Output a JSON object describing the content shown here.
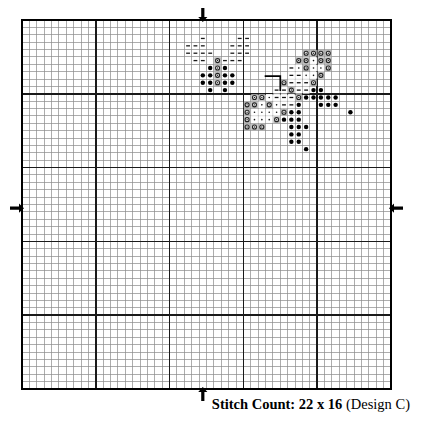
{
  "document": {
    "type": "cross-stitch-pattern-chart",
    "caption_bold": "Stitch Count: 22 x 16",
    "caption_regular": "(Design C)",
    "caption_full": "Stitch Count: 22 x 16 (Design C)"
  },
  "grid": {
    "cols": 50,
    "rows": 50,
    "cell_size": 7.38,
    "origin_x": 22,
    "origin_y": 20,
    "minor_line_color": "#8a8a8a",
    "minor_line_width": 0.7,
    "major_line_color": "#1a1a1a",
    "major_line_width": 1.5,
    "major_every": 10,
    "border_color": "#000000",
    "border_width": 2
  },
  "center_markers": [
    {
      "name": "top-center-arrow",
      "direction": "down",
      "col": 24,
      "side": "top"
    },
    {
      "name": "bottom-center-arrow",
      "direction": "up",
      "col": 24,
      "side": "bottom"
    },
    {
      "name": "left-center-arrow",
      "direction": "right",
      "row": 25,
      "side": "left"
    },
    {
      "name": "right-center-arrow",
      "direction": "left",
      "row": 25,
      "side": "right"
    }
  ],
  "symbols": {
    "legend": [
      {
        "key": "dash",
        "glyph": "–",
        "description": "dash-stitch",
        "fill": "#ffffff",
        "ink": "#1a1a1a"
      },
      {
        "key": "filled-dot",
        "glyph": "●",
        "description": "filled-dot-stitch",
        "fill": "#ffffff",
        "ink": "#000000"
      },
      {
        "key": "open-circle",
        "glyph": "◎",
        "description": "open-circle-stitch",
        "fill": "#b8b8b8",
        "ink": "#222222"
      },
      {
        "key": "small-dot",
        "glyph": "·",
        "description": "small-dot-stitch",
        "fill": "#d8d8d8",
        "ink": "#111111"
      },
      {
        "key": "dash-shaded",
        "glyph": "–",
        "description": "dash-on-shade",
        "fill": "#d8d8d8",
        "ink": "#111111"
      }
    ]
  },
  "chart_data": {
    "type": "heatmap",
    "title": "Stitch Count: 22 x 16 (Design C)",
    "xlabel": "",
    "ylabel": "",
    "grid_cols": 50,
    "grid_rows": 50,
    "cells": [
      {
        "c": 24,
        "r": 2,
        "s": "dash"
      },
      {
        "c": 29,
        "r": 2,
        "s": "dash"
      },
      {
        "c": 30,
        "r": 2,
        "s": "dash"
      },
      {
        "c": 22,
        "r": 3,
        "s": "dash"
      },
      {
        "c": 23,
        "r": 3,
        "s": "dash"
      },
      {
        "c": 24,
        "r": 3,
        "s": "dash"
      },
      {
        "c": 28,
        "r": 3,
        "s": "dash"
      },
      {
        "c": 29,
        "r": 3,
        "s": "dash"
      },
      {
        "c": 30,
        "r": 3,
        "s": "dash"
      },
      {
        "c": 22,
        "r": 4,
        "s": "dash"
      },
      {
        "c": 23,
        "r": 4,
        "s": "dash"
      },
      {
        "c": 24,
        "r": 4,
        "s": "dash"
      },
      {
        "c": 25,
        "r": 4,
        "s": "dash"
      },
      {
        "c": 28,
        "r": 4,
        "s": "dash"
      },
      {
        "c": 29,
        "r": 4,
        "s": "dash"
      },
      {
        "c": 30,
        "r": 4,
        "s": "dash"
      },
      {
        "c": 23,
        "r": 5,
        "s": "dash"
      },
      {
        "c": 24,
        "r": 5,
        "s": "dash"
      },
      {
        "c": 26,
        "r": 5,
        "s": "open-circle"
      },
      {
        "c": 27,
        "r": 5,
        "s": "dash"
      },
      {
        "c": 28,
        "r": 5,
        "s": "dash"
      },
      {
        "c": 29,
        "r": 5,
        "s": "dash"
      },
      {
        "c": 25,
        "r": 6,
        "s": "filled-dot"
      },
      {
        "c": 26,
        "r": 6,
        "s": "open-circle"
      },
      {
        "c": 27,
        "r": 6,
        "s": "filled-dot"
      },
      {
        "c": 24,
        "r": 7,
        "s": "filled-dot"
      },
      {
        "c": 25,
        "r": 7,
        "s": "filled-dot"
      },
      {
        "c": 26,
        "r": 7,
        "s": "open-circle"
      },
      {
        "c": 27,
        "r": 7,
        "s": "filled-dot"
      },
      {
        "c": 28,
        "r": 7,
        "s": "filled-dot"
      },
      {
        "c": 24,
        "r": 8,
        "s": "filled-dot"
      },
      {
        "c": 25,
        "r": 8,
        "s": "filled-dot"
      },
      {
        "c": 26,
        "r": 8,
        "s": "open-circle"
      },
      {
        "c": 27,
        "r": 8,
        "s": "filled-dot"
      },
      {
        "c": 28,
        "r": 8,
        "s": "filled-dot"
      },
      {
        "c": 25,
        "r": 9,
        "s": "filled-dot"
      },
      {
        "c": 27,
        "r": 9,
        "s": "filled-dot"
      },
      {
        "c": 38,
        "r": 4,
        "s": "open-circle"
      },
      {
        "c": 39,
        "r": 4,
        "s": "open-circle"
      },
      {
        "c": 40,
        "r": 4,
        "s": "open-circle"
      },
      {
        "c": 41,
        "r": 4,
        "s": "open-circle"
      },
      {
        "c": 37,
        "r": 5,
        "s": "open-circle"
      },
      {
        "c": 38,
        "r": 5,
        "s": "open-circle"
      },
      {
        "c": 39,
        "r": 5,
        "s": "small-dot"
      },
      {
        "c": 40,
        "r": 5,
        "s": "open-circle"
      },
      {
        "c": 41,
        "r": 5,
        "s": "open-circle"
      },
      {
        "c": 36,
        "r": 6,
        "s": "dash-shaded"
      },
      {
        "c": 37,
        "r": 6,
        "s": "small-dot"
      },
      {
        "c": 38,
        "r": 6,
        "s": "open-circle"
      },
      {
        "c": 39,
        "r": 6,
        "s": "small-dot"
      },
      {
        "c": 40,
        "r": 6,
        "s": "small-dot"
      },
      {
        "c": 41,
        "r": 6,
        "s": "open-circle"
      },
      {
        "c": 36,
        "r": 7,
        "s": "dash-shaded"
      },
      {
        "c": 37,
        "r": 7,
        "s": "dash-shaded"
      },
      {
        "c": 38,
        "r": 7,
        "s": "small-dot"
      },
      {
        "c": 39,
        "r": 7,
        "s": "small-dot"
      },
      {
        "c": 40,
        "r": 7,
        "s": "open-circle"
      },
      {
        "c": 35,
        "r": 8,
        "s": "open-circle"
      },
      {
        "c": 36,
        "r": 8,
        "s": "dash-shaded"
      },
      {
        "c": 37,
        "r": 8,
        "s": "dash-shaded"
      },
      {
        "c": 38,
        "r": 8,
        "s": "dash-shaded"
      },
      {
        "c": 39,
        "r": 8,
        "s": "open-circle"
      },
      {
        "c": 34,
        "r": 9,
        "s": "dash-shaded"
      },
      {
        "c": 35,
        "r": 9,
        "s": "dash-shaded"
      },
      {
        "c": 36,
        "r": 9,
        "s": "open-circle"
      },
      {
        "c": 37,
        "r": 9,
        "s": "dash-shaded"
      },
      {
        "c": 38,
        "r": 9,
        "s": "dash-shaded"
      },
      {
        "c": 39,
        "r": 9,
        "s": "filled-dot"
      },
      {
        "c": 40,
        "r": 9,
        "s": "filled-dot"
      },
      {
        "c": 31,
        "r": 10,
        "s": "open-circle"
      },
      {
        "c": 32,
        "r": 10,
        "s": "open-circle"
      },
      {
        "c": 33,
        "r": 10,
        "s": "small-dot"
      },
      {
        "c": 34,
        "r": 10,
        "s": "dash-shaded"
      },
      {
        "c": 35,
        "r": 10,
        "s": "dash-shaded"
      },
      {
        "c": 36,
        "r": 10,
        "s": "dash-shaded"
      },
      {
        "c": 37,
        "r": 10,
        "s": "open-circle"
      },
      {
        "c": 38,
        "r": 10,
        "s": "filled-dot"
      },
      {
        "c": 39,
        "r": 10,
        "s": "filled-dot"
      },
      {
        "c": 40,
        "r": 10,
        "s": "filled-dot"
      },
      {
        "c": 41,
        "r": 10,
        "s": "filled-dot"
      },
      {
        "c": 42,
        "r": 10,
        "s": "filled-dot"
      },
      {
        "c": 30,
        "r": 11,
        "s": "open-circle"
      },
      {
        "c": 31,
        "r": 11,
        "s": "open-circle"
      },
      {
        "c": 32,
        "r": 11,
        "s": "small-dot"
      },
      {
        "c": 33,
        "r": 11,
        "s": "open-circle"
      },
      {
        "c": 34,
        "r": 11,
        "s": "small-dot"
      },
      {
        "c": 35,
        "r": 11,
        "s": "dash-shaded"
      },
      {
        "c": 36,
        "r": 11,
        "s": "dash-shaded"
      },
      {
        "c": 37,
        "r": 11,
        "s": "filled-dot"
      },
      {
        "c": 40,
        "r": 11,
        "s": "filled-dot"
      },
      {
        "c": 41,
        "r": 11,
        "s": "filled-dot"
      },
      {
        "c": 42,
        "r": 11,
        "s": "filled-dot"
      },
      {
        "c": 30,
        "r": 12,
        "s": "open-circle"
      },
      {
        "c": 31,
        "r": 12,
        "s": "small-dot"
      },
      {
        "c": 32,
        "r": 12,
        "s": "small-dot"
      },
      {
        "c": 33,
        "r": 12,
        "s": "small-dot"
      },
      {
        "c": 34,
        "r": 12,
        "s": "small-dot"
      },
      {
        "c": 35,
        "r": 12,
        "s": "open-circle"
      },
      {
        "c": 36,
        "r": 12,
        "s": "filled-dot"
      },
      {
        "c": 37,
        "r": 12,
        "s": "filled-dot"
      },
      {
        "c": 44,
        "r": 12,
        "s": "filled-dot"
      },
      {
        "c": 30,
        "r": 13,
        "s": "open-circle"
      },
      {
        "c": 31,
        "r": 13,
        "s": "small-dot"
      },
      {
        "c": 32,
        "r": 13,
        "s": "small-dot"
      },
      {
        "c": 33,
        "r": 13,
        "s": "small-dot"
      },
      {
        "c": 34,
        "r": 13,
        "s": "open-circle"
      },
      {
        "c": 35,
        "r": 13,
        "s": "filled-dot"
      },
      {
        "c": 36,
        "r": 13,
        "s": "filled-dot"
      },
      {
        "c": 37,
        "r": 13,
        "s": "filled-dot"
      },
      {
        "c": 30,
        "r": 14,
        "s": "open-circle"
      },
      {
        "c": 31,
        "r": 14,
        "s": "open-circle"
      },
      {
        "c": 32,
        "r": 14,
        "s": "open-circle"
      },
      {
        "c": 36,
        "r": 14,
        "s": "filled-dot"
      },
      {
        "c": 37,
        "r": 14,
        "s": "filled-dot"
      },
      {
        "c": 38,
        "r": 14,
        "s": "filled-dot"
      },
      {
        "c": 36,
        "r": 15,
        "s": "filled-dot"
      },
      {
        "c": 37,
        "r": 15,
        "s": "filled-dot"
      },
      {
        "c": 36,
        "r": 16,
        "s": "filled-dot"
      },
      {
        "c": 37,
        "r": 16,
        "s": "filled-dot"
      },
      {
        "c": 38,
        "r": 17,
        "s": "filled-dot"
      }
    ],
    "backstitch": [
      {
        "name": "backstitch-line",
        "points": [
          [
            33.0,
            7.6
          ],
          [
            35.0,
            7.6
          ],
          [
            35.0,
            9.5
          ]
        ]
      }
    ]
  }
}
